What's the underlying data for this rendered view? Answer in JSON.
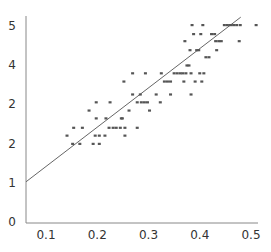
{
  "chart_data": {
    "type": "scatter",
    "title": "",
    "xlabel": "",
    "ylabel": "",
    "xlim": [
      0.06,
      0.52
    ],
    "ylim": [
      0,
      5.1
    ],
    "grid": false,
    "legend": null,
    "x_ticks": [
      {
        "value": 0.1,
        "label": "0.1"
      },
      {
        "value": 0.2,
        "label": "0.2"
      },
      {
        "value": 0.3,
        "label": "0.3"
      },
      {
        "value": 0.4,
        "label": "0.4"
      },
      {
        "value": 0.5,
        "label": "0.5"
      }
    ],
    "y_ticks": [
      {
        "value": 0,
        "label": "0"
      },
      {
        "value": 1,
        "label": "1"
      },
      {
        "value": 2,
        "label": "2"
      },
      {
        "value": 3,
        "label": "2"
      },
      {
        "value": 4,
        "label": "4"
      },
      {
        "value": 5,
        "label": "5"
      }
    ],
    "series": [
      {
        "name": "observations",
        "color": "#555555",
        "points": [
          [
            0.141,
            2.18
          ],
          [
            0.152,
            1.97
          ],
          [
            0.154,
            2.38
          ],
          [
            0.166,
            1.97
          ],
          [
            0.171,
            2.38
          ],
          [
            0.184,
            2.82
          ],
          [
            0.192,
            1.97
          ],
          [
            0.196,
            2.18
          ],
          [
            0.198,
            2.62
          ],
          [
            0.198,
            3.03
          ],
          [
            0.204,
            2.18
          ],
          [
            0.204,
            1.97
          ],
          [
            0.215,
            2.18
          ],
          [
            0.217,
            2.62
          ],
          [
            0.223,
            2.38
          ],
          [
            0.225,
            3.03
          ],
          [
            0.231,
            2.38
          ],
          [
            0.237,
            2.38
          ],
          [
            0.245,
            2.38
          ],
          [
            0.247,
            2.62
          ],
          [
            0.249,
            2.62
          ],
          [
            0.252,
            3.56
          ],
          [
            0.254,
            2.18
          ],
          [
            0.254,
            2.38
          ],
          [
            0.262,
            2.82
          ],
          [
            0.269,
            3.23
          ],
          [
            0.269,
            3.77
          ],
          [
            0.278,
            2.38
          ],
          [
            0.278,
            3.03
          ],
          [
            0.284,
            3.23
          ],
          [
            0.286,
            3.03
          ],
          [
            0.292,
            3.03
          ],
          [
            0.294,
            3.77
          ],
          [
            0.298,
            3.03
          ],
          [
            0.302,
            2.82
          ],
          [
            0.315,
            3.23
          ],
          [
            0.323,
            3.03
          ],
          [
            0.325,
            3.77
          ],
          [
            0.331,
            3.56
          ],
          [
            0.337,
            3.56
          ],
          [
            0.343,
            3.56
          ],
          [
            0.343,
            3.23
          ],
          [
            0.35,
            3.77
          ],
          [
            0.356,
            3.77
          ],
          [
            0.362,
            3.77
          ],
          [
            0.367,
            3.77
          ],
          [
            0.369,
            3.56
          ],
          [
            0.371,
            4.59
          ],
          [
            0.373,
            3.77
          ],
          [
            0.375,
            3.97
          ],
          [
            0.379,
            3.97
          ],
          [
            0.381,
            4.36
          ],
          [
            0.383,
            3.77
          ],
          [
            0.383,
            3.23
          ],
          [
            0.385,
            5.0
          ],
          [
            0.388,
            4.77
          ],
          [
            0.391,
            3.56
          ],
          [
            0.394,
            4.36
          ],
          [
            0.398,
            4.36
          ],
          [
            0.4,
            3.77
          ],
          [
            0.402,
            4.77
          ],
          [
            0.404,
            3.56
          ],
          [
            0.406,
            5.0
          ],
          [
            0.408,
            3.77
          ],
          [
            0.412,
            4.18
          ],
          [
            0.418,
            4.18
          ],
          [
            0.423,
            4.77
          ],
          [
            0.429,
            4.77
          ],
          [
            0.431,
            4.59
          ],
          [
            0.433,
            4.36
          ],
          [
            0.437,
            4.59
          ],
          [
            0.442,
            4.59
          ],
          [
            0.448,
            5.0
          ],
          [
            0.454,
            5.0
          ],
          [
            0.46,
            5.0
          ],
          [
            0.466,
            5.0
          ],
          [
            0.472,
            5.0
          ],
          [
            0.477,
            4.59
          ],
          [
            0.479,
            5.0
          ],
          [
            0.51,
            5.0
          ]
        ]
      }
    ],
    "trendline": {
      "type": "linear",
      "color": "#666666",
      "from": [
        0.06,
        1.0
      ],
      "to": [
        0.48,
        5.2
      ]
    }
  }
}
